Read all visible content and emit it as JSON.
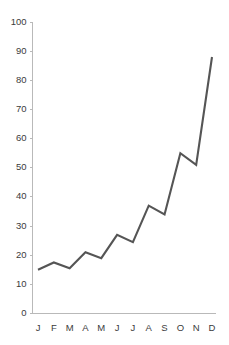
{
  "chart_data": {
    "type": "line",
    "title": "",
    "subtitle": "",
    "xlabel": "",
    "ylabel": "",
    "categories": [
      "J",
      "F",
      "M",
      "A",
      "M",
      "J",
      "J",
      "A",
      "S",
      "O",
      "N",
      "D"
    ],
    "values": [
      15,
      17.5,
      15.5,
      21,
      19,
      27,
      24.5,
      37,
      34,
      55,
      51,
      88
    ],
    "series": [
      {
        "name": "",
        "values": [
          15,
          17.5,
          15.5,
          21,
          19,
          27,
          24.5,
          37,
          34,
          55,
          51,
          88
        ]
      }
    ],
    "ylim": [
      0,
      100
    ],
    "ytick_values": [
      0,
      10,
      20,
      30,
      40,
      50,
      60,
      70,
      80,
      90,
      100
    ],
    "ytick_labels": [
      "0",
      "10",
      "20",
      "30",
      "40",
      "50",
      "60",
      "70",
      "80",
      "90",
      "100"
    ],
    "xtick_labels": [
      "J",
      "F",
      "M",
      "A",
      "M",
      "J",
      "J",
      "A",
      "S",
      "O",
      "N",
      "D"
    ],
    "grid": false,
    "legend": false,
    "legend_position": "none",
    "annotations": [],
    "colors": {
      "line": "#555555",
      "axis": "#b9b9b9",
      "tick_text": "#3b3b3b",
      "background": "#ffffff"
    }
  }
}
